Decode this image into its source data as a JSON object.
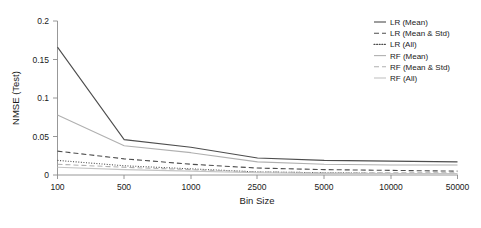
{
  "chart_data": {
    "type": "line",
    "title": "",
    "xlabel": "Bin Size",
    "ylabel": "NMSE (Test)",
    "categories": [
      "100",
      "500",
      "1000",
      "2500",
      "5000",
      "10000",
      "50000"
    ],
    "xtick_labels": [
      "100",
      "500",
      "1000",
      "2500",
      "5000",
      "10000",
      "50000"
    ],
    "ytick_labels": [
      "0",
      "0.05",
      "0.1",
      "0.15",
      "0.2"
    ],
    "ytick_values": [
      0,
      0.05,
      0.1,
      0.15,
      0.2
    ],
    "ylim": [
      0,
      0.2
    ],
    "grid": false,
    "legend_position": "top-right",
    "series": [
      {
        "name": "LR (Mean)",
        "values": [
          0.166,
          0.046,
          0.036,
          0.022,
          0.019,
          0.018,
          0.017
        ],
        "color": "#4d4d4d",
        "style": "solid"
      },
      {
        "name": "LR (Mean & Std)",
        "values": [
          0.031,
          0.021,
          0.014,
          0.009,
          0.007,
          0.006,
          0.005
        ],
        "color": "#4d4d4d",
        "style": "dashed"
      },
      {
        "name": "LR (All)",
        "values": [
          0.019,
          0.012,
          0.008,
          0.004,
          0.003,
          0.002,
          0.002
        ],
        "color": "#4d4d4d",
        "style": "dotted"
      },
      {
        "name": "RF (Mean)",
        "values": [
          0.078,
          0.038,
          0.029,
          0.017,
          0.014,
          0.013,
          0.013
        ],
        "color": "#b0b0b0",
        "style": "solid"
      },
      {
        "name": "RF (Mean & Std)",
        "values": [
          0.014,
          0.01,
          0.007,
          0.004,
          0.003,
          0.003,
          0.003
        ],
        "color": "#b0b0b0",
        "style": "dashed"
      },
      {
        "name": "RF (All)",
        "values": [
          0.01,
          0.007,
          0.005,
          0.003,
          0.002,
          0.002,
          0.002
        ],
        "color": "#c4c4c4",
        "style": "solid"
      }
    ]
  },
  "axes": {
    "ylabel": "NMSE (Test)",
    "xlabel": "Bin Size"
  },
  "legend": {
    "entries": [
      {
        "label": "LR (Mean)"
      },
      {
        "label": "LR (Mean & Std)"
      },
      {
        "label": "LR (All)"
      },
      {
        "label": "RF (Mean)"
      },
      {
        "label": "RF (Mean & Std)"
      },
      {
        "label": "RF (All)"
      }
    ]
  }
}
